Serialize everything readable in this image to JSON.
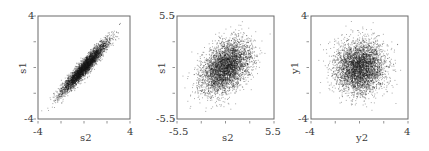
{
  "chart_data": [
    {
      "type": "scatter",
      "title": "",
      "xlabel": "s2",
      "ylabel": "s1",
      "xlim": [
        -4,
        4
      ],
      "ylim": [
        -4,
        4
      ],
      "x_tick_labels": [
        "-4",
        "4"
      ],
      "y_tick_labels": [
        "-4",
        "4"
      ],
      "n_minor_ticks": 5,
      "grid": false,
      "distribution": {
        "mean": [
          0,
          0
        ],
        "std": [
          1,
          1
        ],
        "correlation": 0.95,
        "n_points": 4000
      },
      "marker_color": "#1a1a1a"
    },
    {
      "type": "scatter",
      "title": "",
      "xlabel": "s2",
      "ylabel": "s1",
      "xlim": [
        -5.5,
        5.5
      ],
      "ylim": [
        -5.5,
        5.5
      ],
      "x_tick_labels": [
        "-5.5",
        "5.5"
      ],
      "y_tick_labels": [
        "-5.5",
        "5.5"
      ],
      "n_minor_ticks": 5,
      "grid": false,
      "distribution": {
        "mean": [
          0,
          0
        ],
        "std": [
          1.4,
          1.4
        ],
        "correlation": 0.4,
        "n_points": 4000
      },
      "marker_color": "#1a1a1a"
    },
    {
      "type": "scatter",
      "title": "",
      "xlabel": "y2",
      "ylabel": "y1",
      "xlim": [
        -4,
        4
      ],
      "ylim": [
        -4,
        4
      ],
      "x_tick_labels": [
        "-4",
        "4"
      ],
      "y_tick_labels": [
        "-4",
        "4"
      ],
      "n_minor_ticks": 5,
      "grid": false,
      "distribution": {
        "mean": [
          0,
          0
        ],
        "std": [
          1,
          1
        ],
        "correlation": 0.0,
        "n_points": 4000
      },
      "marker_color": "#1a1a1a"
    }
  ],
  "panels": [
    {
      "xlabel": "s2",
      "ylabel": "s1",
      "xmin": "-4",
      "xmax": "4",
      "ymin": "-4",
      "ymax": "4"
    },
    {
      "xlabel": "s2",
      "ylabel": "s1",
      "xmin": "-5.5",
      "xmax": "5.5",
      "ymin": "-5.5",
      "ymax": "5.5"
    },
    {
      "xlabel": "y2",
      "ylabel": "y1",
      "xmin": "-4",
      "xmax": "4",
      "ymin": "-4",
      "ymax": "4"
    }
  ]
}
